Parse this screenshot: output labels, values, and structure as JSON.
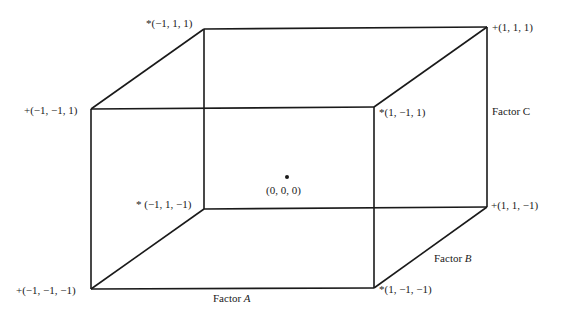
{
  "diagram": {
    "type": "cube-design-space",
    "line_color": "#1a1a1a",
    "center": {
      "label": "(0, 0, 0)"
    },
    "vertices": [
      {
        "id": "v1",
        "label": "*(−1, 1, 1)"
      },
      {
        "id": "v2",
        "label": "+(1, 1, 1)"
      },
      {
        "id": "v3",
        "label": "+(−1, −1, 1)"
      },
      {
        "id": "v4",
        "label": "*(1, −1, 1)"
      },
      {
        "id": "v5",
        "label": "* (−1, 1, −1)"
      },
      {
        "id": "v6",
        "label": "+(1, 1, −1)"
      },
      {
        "id": "v7",
        "label": "+(−1, −1, −1)"
      },
      {
        "id": "v8",
        "label": "*(1, −1, −1)"
      }
    ],
    "axes": {
      "a": {
        "prefix": "Factor ",
        "name": "A"
      },
      "b": {
        "prefix": "Factor ",
        "name": "B"
      },
      "c": {
        "label": "Factor C"
      }
    }
  }
}
